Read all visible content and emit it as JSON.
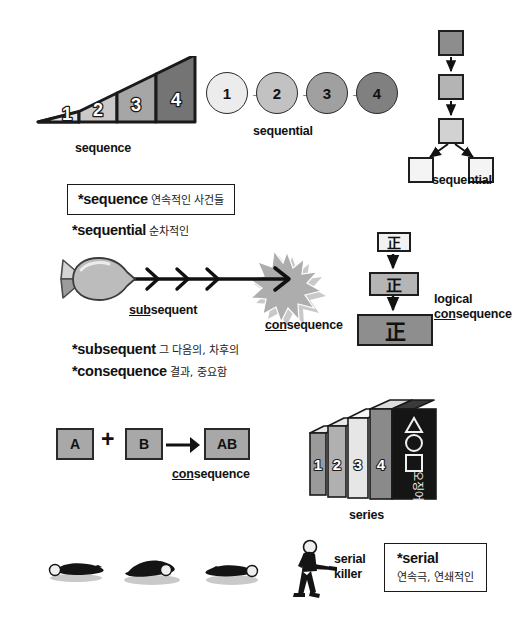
{
  "sequence_triangle": {
    "label": "sequence",
    "steps": [
      {
        "num": "1",
        "color": "#e4e4e4"
      },
      {
        "num": "2",
        "color": "#c9c9c9"
      },
      {
        "num": "3",
        "color": "#a6a6a6"
      },
      {
        "num": "4",
        "color": "#747474"
      }
    ]
  },
  "sequential_circles": {
    "label": "sequential",
    "arrow": "→",
    "nodes": [
      {
        "num": "1",
        "color": "#ececec"
      },
      {
        "num": "2",
        "color": "#c2c2c2"
      },
      {
        "num": "3",
        "color": "#a0a0a0"
      },
      {
        "num": "4",
        "color": "#808080"
      }
    ]
  },
  "sequential_flow": {
    "label": "sequential",
    "nodes": [
      {
        "color": "#8d8d8d"
      },
      {
        "color": "#b4b4b4"
      },
      {
        "color": "#d2d2d2"
      },
      {
        "color": "#f4f4f4"
      },
      {
        "color": "#f4f4f4"
      }
    ]
  },
  "vocab_sequence": {
    "en": "*sequence",
    "ko": "연속적인 사건들"
  },
  "vocab_sequential": {
    "en": "*sequential",
    "ko": "순차적인"
  },
  "vocab_block": [
    {
      "en": "*subsequent",
      "ko": "그 다음의, 차후의"
    },
    {
      "en": "*consequence",
      "ko": "결과, 중요함"
    }
  ],
  "missile_scene": {
    "subsequent_prefix": "sub",
    "subsequent_rest": "sequent",
    "consequence_prefix": "con",
    "consequence_rest": "sequence"
  },
  "logical_consequence": {
    "glyph": "正",
    "line1": "logical",
    "prefix": "con",
    "rest": "sequence",
    "boxes": [
      {
        "color": "#f2f2f2"
      },
      {
        "color": "#b5b5b5"
      },
      {
        "color": "#8e8e8e"
      }
    ]
  },
  "ab_equation": {
    "a": "A",
    "plus": "+",
    "b": "B",
    "result": "AB",
    "consequence_prefix": "con",
    "consequence_rest": "sequence"
  },
  "series_books": {
    "label": "series",
    "spines": [
      {
        "num": "1",
        "color": "#9a9a9a"
      },
      {
        "num": "2",
        "color": "#b0b0b0"
      },
      {
        "num": "3",
        "color": "#e6e6e6"
      },
      {
        "num": "4",
        "color": "#8a8a8a"
      }
    ],
    "cover_color": "#151515",
    "cover_symbols": [
      "triangle",
      "circle",
      "square"
    ],
    "cover_text": "오징어"
  },
  "serial_killer": {
    "line1": "serial",
    "line2": "killer",
    "bodies": 3
  },
  "vocab_serial": {
    "en": "*serial",
    "ko": "연속극, 연쇄적인"
  },
  "colors": {
    "ink": "#111111",
    "outline": "#1d1d1d",
    "paper": "#ffffff",
    "missile_body": "#b9b9b9",
    "explosion": "#b0b0b0",
    "shadow": "#c6c6c6"
  }
}
